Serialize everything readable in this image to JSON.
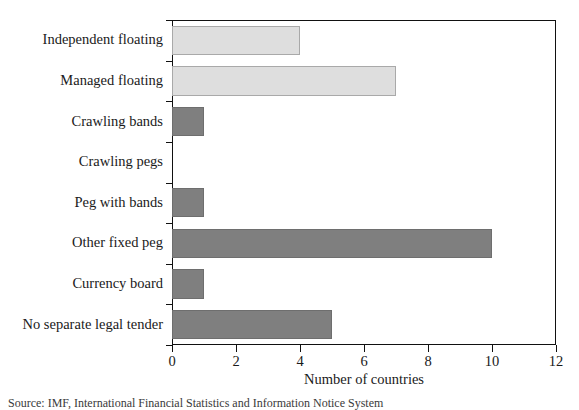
{
  "chart_data": {
    "type": "bar",
    "orientation": "horizontal",
    "title": "",
    "subtitle": "",
    "xlabel": "Number of countries",
    "ylabel": "",
    "xlim": [
      0,
      12
    ],
    "xticks": [
      0,
      2,
      4,
      6,
      8,
      10,
      12
    ],
    "xtick_labels": [
      "0",
      "2",
      "4",
      "6",
      "8",
      "10",
      "12"
    ],
    "grid": false,
    "legend": null,
    "categories": [
      "Independent floating",
      "Managed floating",
      "Crawling bands",
      "Crawling pegs",
      "Peg with bands",
      "Other fixed peg",
      "Currency board",
      "No separate legal tender"
    ],
    "values": [
      4,
      7,
      1,
      0,
      1,
      10,
      1,
      5
    ],
    "bar_styles": [
      "light",
      "light",
      "dark",
      "dark",
      "dark",
      "dark",
      "dark",
      "dark"
    ],
    "colors": {
      "light_bar": "#dedede",
      "light_bar_edge": "#a9a9a9",
      "dark_bar": "#7f7f7f",
      "dark_bar_edge": "#6e6e6e",
      "axis": "#111111",
      "text": "#1a1a1a",
      "background": "#ffffff"
    }
  },
  "footer": {
    "source_note": "Source: IMF, International Financial Statistics and Information Notice System"
  }
}
